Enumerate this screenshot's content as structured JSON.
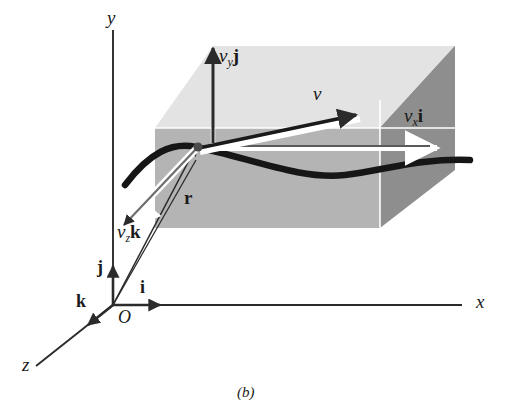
{
  "figure": {
    "caption": "(b)",
    "background_color": "#ffffff",
    "line_color": "#2b2b2b",
    "plane_top_color": "#e2e2e2",
    "plane_mid_color": "#b6b6b6",
    "plane_right_color": "#8f8f8f",
    "curve_color": "#1a1a1a",
    "white_highlight_color": "#ffffff"
  },
  "axes": [
    {
      "name": "y-axis",
      "label": "y"
    },
    {
      "name": "x-axis",
      "label": "x"
    },
    {
      "name": "z-axis",
      "label": "z"
    }
  ],
  "origin": {
    "label": "O"
  },
  "unit_vectors": [
    {
      "name": "i-hat",
      "label": "i",
      "axis": "x"
    },
    {
      "name": "j-hat",
      "label": "j",
      "axis": "y"
    },
    {
      "name": "k-hat",
      "label": "k",
      "axis": "z"
    }
  ],
  "vectors": [
    {
      "name": "position-vector-r",
      "symbol": "r",
      "kind": "bold-plain",
      "description": "position vector from origin to particle"
    },
    {
      "name": "velocity-vector-v",
      "symbol": "v",
      "kind": "italic",
      "description": "velocity vector tangent to path"
    },
    {
      "name": "velocity-component-x",
      "base": "v",
      "subscript": "x",
      "unit": "i",
      "description": "x component of velocity"
    },
    {
      "name": "velocity-component-y",
      "base": "v",
      "subscript": "y",
      "unit": "j",
      "description": "y component of velocity"
    },
    {
      "name": "velocity-component-z",
      "base": "v",
      "subscript": "z",
      "unit": "k",
      "description": "z component of velocity"
    }
  ],
  "path_curve": {
    "name": "particle-trajectory",
    "description": "dark curved trajectory of the particle"
  }
}
